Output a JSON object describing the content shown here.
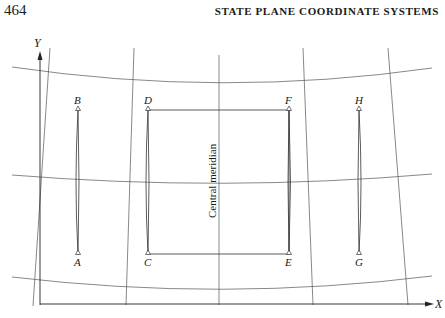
{
  "page": {
    "number": "464",
    "running_head": "STATE PLANE COORDINATE SYSTEMS"
  },
  "figure": {
    "axes": {
      "x_label": "X",
      "y_label": "Y"
    },
    "central_meridian_label": "Central meridian",
    "points": [
      {
        "id": "B",
        "label": "B"
      },
      {
        "id": "A",
        "label": "A"
      },
      {
        "id": "D",
        "label": "D"
      },
      {
        "id": "C",
        "label": "C"
      },
      {
        "id": "F",
        "label": "F"
      },
      {
        "id": "E",
        "label": "E"
      },
      {
        "id": "H",
        "label": "H"
      },
      {
        "id": "G",
        "label": "G"
      }
    ]
  }
}
